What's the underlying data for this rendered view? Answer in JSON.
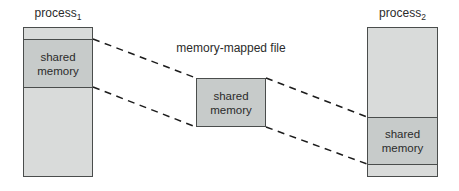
{
  "colors": {
    "background": "#ffffff",
    "region_fill": "#d9dbda",
    "shared_fill": "#c7cbca",
    "border": "#4a4d4c",
    "connector": "#1c1c1c",
    "text": "#2b2b2b"
  },
  "process1": {
    "title_base": "process",
    "title_sub": "1",
    "shared_label": "shared memory"
  },
  "mapped_file": {
    "title": "memory-mapped file",
    "shared_label": "shared memory"
  },
  "process2": {
    "title_base": "process",
    "title_sub": "2",
    "shared_label": "shared memory"
  }
}
